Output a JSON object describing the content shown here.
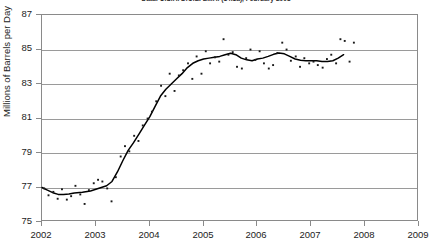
{
  "chart_data": {
    "type": "scatter",
    "title": "Data: U.S.A. D.O.E. E.I.A. (14.1a), February 2008",
    "xlabel": "",
    "ylabel": "Millions of Barrels per Day",
    "xlim": [
      2002,
      2009
    ],
    "ylim": [
      75,
      87
    ],
    "xticks": [
      2002,
      2003,
      2004,
      2005,
      2006,
      2007,
      2008,
      2009
    ],
    "yticks": [
      75,
      77,
      79,
      81,
      83,
      85,
      87
    ],
    "grid": "horizontal",
    "legend": "none",
    "marker_color": "#1a1a1a",
    "line_color": "#000000",
    "frame_color": "#8a8a8a",
    "grid_color": "#9a9a9a",
    "series": [
      {
        "name": "Monthly world oil supply",
        "type": "scatter",
        "marker": "small-square",
        "points": [
          [
            2002.04,
            76.95
          ],
          [
            2002.12,
            76.55
          ],
          [
            2002.21,
            76.75
          ],
          [
            2002.29,
            76.35
          ],
          [
            2002.37,
            76.9
          ],
          [
            2002.46,
            76.3
          ],
          [
            2002.54,
            76.5
          ],
          [
            2002.62,
            77.1
          ],
          [
            2002.71,
            76.6
          ],
          [
            2002.79,
            76.05
          ],
          [
            2002.87,
            76.85
          ],
          [
            2002.96,
            77.25
          ],
          [
            2003.04,
            77.45
          ],
          [
            2003.12,
            77.35
          ],
          [
            2003.21,
            76.95
          ],
          [
            2003.29,
            76.2
          ],
          [
            2003.37,
            77.6
          ],
          [
            2003.46,
            78.8
          ],
          [
            2003.54,
            79.4
          ],
          [
            2003.62,
            79.1
          ],
          [
            2003.71,
            80.0
          ],
          [
            2003.79,
            79.7
          ],
          [
            2003.87,
            80.6
          ],
          [
            2003.96,
            81.0
          ],
          [
            2004.04,
            81.4
          ],
          [
            2004.12,
            82.0
          ],
          [
            2004.21,
            82.9
          ],
          [
            2004.29,
            82.3
          ],
          [
            2004.37,
            83.6
          ],
          [
            2004.46,
            82.6
          ],
          [
            2004.54,
            83.5
          ],
          [
            2004.62,
            83.8
          ],
          [
            2004.71,
            84.2
          ],
          [
            2004.79,
            83.3
          ],
          [
            2004.87,
            84.6
          ],
          [
            2004.96,
            83.6
          ],
          [
            2005.04,
            84.9
          ],
          [
            2005.12,
            84.2
          ],
          [
            2005.21,
            84.55
          ],
          [
            2005.29,
            84.3
          ],
          [
            2005.37,
            85.6
          ],
          [
            2005.46,
            84.7
          ],
          [
            2005.54,
            84.85
          ],
          [
            2005.62,
            84.0
          ],
          [
            2005.71,
            83.9
          ],
          [
            2005.79,
            84.5
          ],
          [
            2005.87,
            85.0
          ],
          [
            2005.96,
            84.4
          ],
          [
            2006.04,
            84.9
          ],
          [
            2006.12,
            84.2
          ],
          [
            2006.21,
            83.9
          ],
          [
            2006.29,
            84.1
          ],
          [
            2006.37,
            84.8
          ],
          [
            2006.46,
            85.4
          ],
          [
            2006.54,
            85.0
          ],
          [
            2006.62,
            84.35
          ],
          [
            2006.71,
            84.6
          ],
          [
            2006.79,
            84.0
          ],
          [
            2006.87,
            84.5
          ],
          [
            2006.96,
            84.2
          ],
          [
            2007.04,
            84.3
          ],
          [
            2007.12,
            84.1
          ],
          [
            2007.21,
            83.95
          ],
          [
            2007.29,
            84.45
          ],
          [
            2007.37,
            84.7
          ],
          [
            2007.46,
            84.2
          ],
          [
            2007.54,
            85.6
          ],
          [
            2007.62,
            85.5
          ],
          [
            2007.71,
            84.3
          ],
          [
            2007.79,
            85.4
          ]
        ]
      },
      {
        "name": "Smoothed trend (12-month moving average)",
        "type": "line",
        "points": [
          [
            2002.0,
            77.0
          ],
          [
            2002.1,
            76.85
          ],
          [
            2002.2,
            76.7
          ],
          [
            2002.3,
            76.6
          ],
          [
            2002.4,
            76.6
          ],
          [
            2002.5,
            76.62
          ],
          [
            2002.6,
            76.68
          ],
          [
            2002.75,
            76.72
          ],
          [
            2002.9,
            76.8
          ],
          [
            2003.0,
            76.9
          ],
          [
            2003.1,
            77.0
          ],
          [
            2003.2,
            77.1
          ],
          [
            2003.3,
            77.35
          ],
          [
            2003.4,
            77.9
          ],
          [
            2003.5,
            78.55
          ],
          [
            2003.6,
            79.15
          ],
          [
            2003.7,
            79.6
          ],
          [
            2003.8,
            80.1
          ],
          [
            2003.9,
            80.6
          ],
          [
            2004.0,
            81.1
          ],
          [
            2004.1,
            81.7
          ],
          [
            2004.2,
            82.3
          ],
          [
            2004.3,
            82.7
          ],
          [
            2004.4,
            83.0
          ],
          [
            2004.5,
            83.3
          ],
          [
            2004.6,
            83.6
          ],
          [
            2004.7,
            83.95
          ],
          [
            2004.8,
            84.2
          ],
          [
            2004.9,
            84.35
          ],
          [
            2005.0,
            84.45
          ],
          [
            2005.1,
            84.5
          ],
          [
            2005.2,
            84.55
          ],
          [
            2005.3,
            84.6
          ],
          [
            2005.4,
            84.7
          ],
          [
            2005.5,
            84.78
          ],
          [
            2005.6,
            84.7
          ],
          [
            2005.7,
            84.5
          ],
          [
            2005.8,
            84.4
          ],
          [
            2005.9,
            84.35
          ],
          [
            2006.0,
            84.45
          ],
          [
            2006.1,
            84.5
          ],
          [
            2006.2,
            84.6
          ],
          [
            2006.3,
            84.72
          ],
          [
            2006.4,
            84.8
          ],
          [
            2006.5,
            84.75
          ],
          [
            2006.6,
            84.6
          ],
          [
            2006.7,
            84.45
          ],
          [
            2006.8,
            84.38
          ],
          [
            2006.9,
            84.35
          ],
          [
            2007.0,
            84.35
          ],
          [
            2007.1,
            84.35
          ],
          [
            2007.2,
            84.3
          ],
          [
            2007.3,
            84.3
          ],
          [
            2007.4,
            84.35
          ],
          [
            2007.5,
            84.5
          ],
          [
            2007.6,
            84.7
          ]
        ]
      }
    ]
  }
}
